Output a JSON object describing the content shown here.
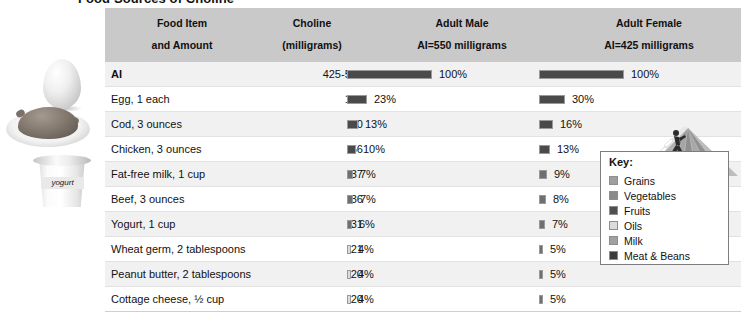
{
  "title": "Food Sources of Choline",
  "table": {
    "headers": {
      "food": "Food Item",
      "food_sub": "and Amount",
      "choline": "Choline",
      "choline_sub": "(milligrams)",
      "male": "Adult Male",
      "male_sub": "AI=550 milligrams",
      "male_sub2": "%AI",
      "female": "Adult Female",
      "female_sub": "AI=425 milligrams",
      "female_sub2": "%AI"
    },
    "rows": [
      {
        "food": "AI",
        "mg": "425-550",
        "male_pct": "100%",
        "male_val": 100,
        "female_pct": "100%",
        "female_val": 100
      },
      {
        "food": "Egg, 1 each",
        "mg": "126",
        "male_pct": "23%",
        "male_val": 23,
        "female_pct": "30%",
        "female_val": 30
      },
      {
        "food": "Cod, 3 ounces",
        "mg": "70",
        "male_pct": "13%",
        "male_val": 13,
        "female_pct": "16%",
        "female_val": 16
      },
      {
        "food": "Chicken, 3 ounces",
        "mg": "56",
        "male_pct": "10%",
        "male_val": 10,
        "female_pct": "13%",
        "female_val": 13
      },
      {
        "food": "Fat-free milk, 1 cup",
        "mg": "37",
        "male_pct": "7%",
        "male_val": 7,
        "female_pct": "9%",
        "female_val": 9
      },
      {
        "food": "Beef, 3 ounces",
        "mg": "36",
        "male_pct": "7%",
        "male_val": 7,
        "female_pct": "8%",
        "female_val": 8
      },
      {
        "food": "Yogurt, 1 cup",
        "mg": "31",
        "male_pct": "6%",
        "male_val": 6,
        "female_pct": "7%",
        "female_val": 7
      },
      {
        "food": "Wheat germ, 2 tablespoons",
        "mg": "21",
        "male_pct": "4%",
        "male_val": 4,
        "female_pct": "5%",
        "female_val": 5
      },
      {
        "food": "Peanut butter, 2 tablespoons",
        "mg": "20",
        "male_pct": "4%",
        "male_val": 4,
        "female_pct": "5%",
        "female_val": 5
      },
      {
        "food": "Cottage cheese, ½ cup",
        "mg": "20",
        "male_pct": "4%",
        "male_val": 4,
        "female_pct": "5%",
        "female_val": 5
      }
    ]
  },
  "key": {
    "title": "Key:",
    "items": [
      {
        "label": "Grains",
        "color": "#9e9e9e"
      },
      {
        "label": "Vegetables",
        "color": "#8a8a8a"
      },
      {
        "label": "Fruits",
        "color": "#4f4f4f"
      },
      {
        "label": "Oils",
        "color": "#dcdcdc"
      },
      {
        "label": "Milk",
        "color": "#a0a0a0"
      },
      {
        "label": "Meat & Beans",
        "color": "#3c3c3c"
      }
    ]
  },
  "photos": [
    {
      "name": "egg-photo",
      "label": ""
    },
    {
      "name": "roast-chicken-photo",
      "label": ""
    },
    {
      "name": "yogurt-cup-photo",
      "label": "yogurt"
    }
  ],
  "pyramid": {
    "name": "mypyramid-graphic"
  },
  "chart_data": {
    "type": "bar",
    "title": "Food Sources of Choline",
    "xlabel": "%AI",
    "ylabel": "Food Item and Amount",
    "categories": [
      "AI",
      "Egg, 1 each",
      "Cod, 3 ounces",
      "Chicken, 3 ounces",
      "Fat-free milk, 1 cup",
      "Beef, 3 ounces",
      "Yogurt, 1 cup",
      "Wheat germ, 2 tablespoons",
      "Peanut butter, 2 tablespoons",
      "Cottage cheese, ½ cup"
    ],
    "choline_mg": [
      "425-550",
      "126",
      "70",
      "56",
      "37",
      "36",
      "31",
      "21",
      "20",
      "20"
    ],
    "series": [
      {
        "name": "Adult Male AI=550 milligrams %AI",
        "values": [
          100,
          23,
          13,
          10,
          7,
          7,
          6,
          4,
          4,
          4
        ]
      },
      {
        "name": "Adult Female AI=425 milligrams %AI",
        "values": [
          100,
          30,
          16,
          13,
          9,
          8,
          7,
          5,
          5,
          5
        ]
      }
    ],
    "xlim": [
      0,
      100
    ],
    "grid": false,
    "legend": "right"
  }
}
